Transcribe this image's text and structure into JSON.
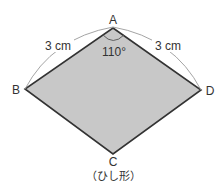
{
  "figure": {
    "caption": "（ひし形）",
    "shape": "rhombus",
    "vertices": {
      "A": {
        "label": "A",
        "x": 113,
        "y": 28
      },
      "B": {
        "label": "B",
        "x": 25,
        "y": 89
      },
      "C": {
        "label": "C",
        "x": 113,
        "y": 154
      },
      "D": {
        "label": "D",
        "x": 201,
        "y": 90
      }
    },
    "side_labels": {
      "AB": "3 cm",
      "AD": "3 cm"
    },
    "angle_label": "110°",
    "colors": {
      "fill": "#c8c8c8",
      "stroke": "#333333",
      "arc": "#9a9a9a",
      "text": "#333333"
    }
  }
}
